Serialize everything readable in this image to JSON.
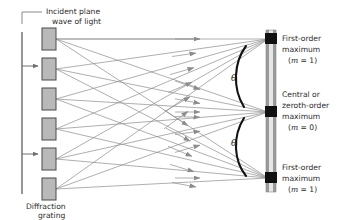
{
  "figure": {
    "title_alt": "Diffraction grating interference diagram",
    "background_color": "#ffffff",
    "ray_color": "#8c8c8c",
    "arc_color": "#121212",
    "slit_fill": "#b9b9b9",
    "slit_stroke": "#4a4a4a",
    "screen_fill": "#9a9a9a",
    "screen_inner": "#e8e8e8",
    "maximum_color": "#111111",
    "text_color": "#2b2b2b"
  },
  "labels": {
    "incident_line1": "Incident plane",
    "incident_line2": "wave of light",
    "grating_line1": "Diffraction",
    "grating_line2": "grating",
    "first_order_top_line1": "First-order",
    "first_order_top_line2": "maximum",
    "first_order_top_order_m": "m",
    "first_order_top_order_rest": " = 1)",
    "first_order_top_order_open": "(",
    "central_line1": "Central or",
    "central_line2": "zeroth-order",
    "central_line3": "maximum",
    "central_order_open": "(",
    "central_order_m": "m",
    "central_order_rest": " = 0)",
    "first_order_bottom_line1": "First-order",
    "first_order_bottom_line2": "maximum",
    "first_order_bottom_order_open": "(",
    "first_order_bottom_order_m": "m",
    "first_order_bottom_order_rest": " = 1)",
    "theta_upper": "θ",
    "theta_lower": "θ"
  },
  "geometry": {
    "slit_x": 42,
    "slit_width": 14,
    "slit_height": 22,
    "slit_count": 6,
    "slit_y_positions": [
      28,
      58,
      88,
      118,
      148,
      178
    ],
    "screen_x": 268,
    "screen_top": 30,
    "screen_bottom": 192,
    "maxima_y": [
      39,
      112,
      178
    ],
    "wavefront_x": 22,
    "wavefront_top": 32,
    "wavefront_bottom": 194,
    "incident_arrow_y": [
      66,
      154
    ]
  },
  "physics": {
    "orders_shown": [
      1,
      0,
      1
    ],
    "angle_symbol": "θ",
    "description": "Incident plane wave of light strikes a diffraction grating with six slits; diffracted rays converge to a central zeroth-order maximum and two first-order maxima on the screen, each at angle theta from the central axis."
  }
}
